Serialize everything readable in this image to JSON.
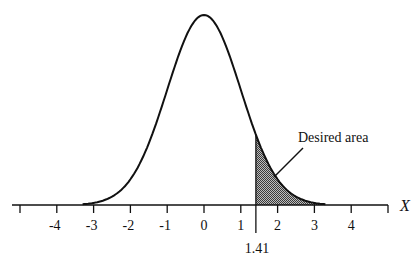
{
  "chart_data": {
    "type": "area",
    "title": "",
    "xlabel": "X",
    "ylabel": "",
    "xlim": [
      -5,
      5
    ],
    "x_ticks": [
      -5,
      -4,
      -3,
      -2,
      -1,
      0,
      1,
      2,
      3,
      4,
      5
    ],
    "x_tick_labels": [
      "-4",
      "-3",
      "-2",
      "-1",
      "0",
      "1",
      "2",
      "3",
      "4"
    ],
    "x_tick_label_values": [
      -4,
      -3,
      -2,
      -1,
      0,
      1,
      2,
      3,
      4
    ],
    "curve": {
      "distribution": "normal",
      "mean": 0,
      "sd": 1
    },
    "shaded_region": {
      "from": 1.41,
      "to": 3.3,
      "label": "Desired area"
    },
    "marker": {
      "x": 1.41,
      "label": "1.41"
    },
    "grid": false,
    "legend": null
  },
  "labels": {
    "axis_name": "X",
    "marker_value": "1.41",
    "annotation": "Desired area",
    "ticks": [
      "-4",
      "-3",
      "-2",
      "-1",
      "0",
      "1",
      "2",
      "3",
      "4"
    ]
  },
  "colors": {
    "line": "#111111",
    "shade": "#8a8a8a",
    "background": "#ffffff"
  }
}
